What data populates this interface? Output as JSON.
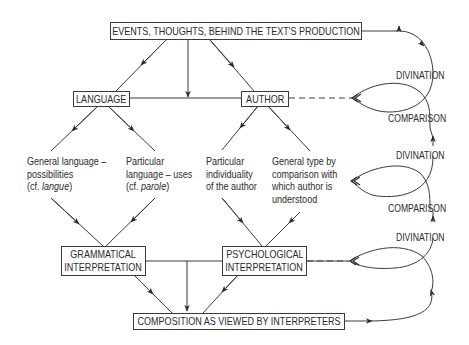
{
  "boxes": {
    "events": "EVENTS, THOUGHTS, BEHIND THE TEXT'S PRODUCTION",
    "language": "LANGUAGE",
    "author": "AUTHOR",
    "grammatical_1": "GRAMMATICAL",
    "grammatical_2": "INTERPRETATION",
    "psychological_1": "PSYCHOLOGICAL",
    "psychological_2": "INTERPRETATION",
    "composition": "COMPOSITION AS VIEWED BY INTERPRETERS"
  },
  "texts": {
    "general_language": {
      "l1": "General language –",
      "l2": "possibilities",
      "l3a": "(cf. ",
      "l3b": "langue",
      "l3c": ")"
    },
    "particular_language": {
      "l1": "Particular",
      "l2": "language – uses",
      "l3a": "(cf. ",
      "l3b": "parole",
      "l3c": ")"
    },
    "particular_individuality": {
      "l1": "Particular",
      "l2": "individuality",
      "l3": "of the author"
    },
    "general_type": {
      "l1": "General type by",
      "l2": "comparison with",
      "l3": "which author is",
      "l4": "understood"
    }
  },
  "loop_labels": [
    "DIVINATION",
    "COMPARISON",
    "DIVINATION",
    "COMPARISON",
    "DIVINATION"
  ]
}
